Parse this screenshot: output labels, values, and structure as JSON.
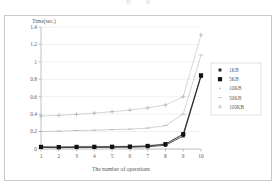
{
  "figure": {
    "top_bleed_fragments": [
      "b",
      "a"
    ],
    "border_color": "#c9c9c9"
  },
  "chart_data": {
    "type": "line",
    "title": "",
    "xlabel": "The number of operations",
    "ylabel": "Time(sec.)",
    "x": [
      1,
      2,
      3,
      4,
      5,
      6,
      7,
      8,
      9,
      10
    ],
    "xlim": [
      1,
      10
    ],
    "ylim": [
      0,
      1.4
    ],
    "ytick_labels": [
      "0",
      "0.2",
      "0.4",
      "0.6",
      "0.8",
      "1",
      "1.2",
      "1.4"
    ],
    "ytick_values": [
      0,
      0.2,
      0.4,
      0.6,
      0.8,
      1.0,
      1.2,
      1.4
    ],
    "xtick_labels": [
      "1",
      "2",
      "3",
      "4",
      "5",
      "6",
      "7",
      "8",
      "9",
      "10"
    ],
    "grid": "horizontal",
    "legend_position": "right",
    "series": [
      {
        "name": "1KB",
        "marker": "small-dot",
        "color": "#2b2b2b",
        "values": [
          0.018,
          0.016,
          0.018,
          0.018,
          0.019,
          0.02,
          0.026,
          0.042,
          0.15,
          0.83
        ]
      },
      {
        "name": "5KB",
        "marker": "filled-square",
        "color": "#111111",
        "values": [
          0.024,
          0.022,
          0.024,
          0.025,
          0.026,
          0.028,
          0.035,
          0.056,
          0.17,
          0.845
        ]
      },
      {
        "name": "10KB",
        "marker": "faint-dot",
        "color": "#b4b4b4",
        "values": [
          0.03,
          0.029,
          0.03,
          0.031,
          0.033,
          0.035,
          0.042,
          0.062,
          0.178,
          0.85
        ]
      },
      {
        "name": "50KB",
        "marker": "dash",
        "color": "#9e9e9e",
        "values": [
          0.2,
          0.205,
          0.212,
          0.216,
          0.222,
          0.228,
          0.24,
          0.268,
          0.4,
          1.08
        ]
      },
      {
        "name": "100KB",
        "marker": "plus",
        "color": "#a8a8a8",
        "values": [
          0.378,
          0.386,
          0.398,
          0.412,
          0.428,
          0.446,
          0.472,
          0.505,
          0.6,
          1.31
        ]
      }
    ]
  }
}
